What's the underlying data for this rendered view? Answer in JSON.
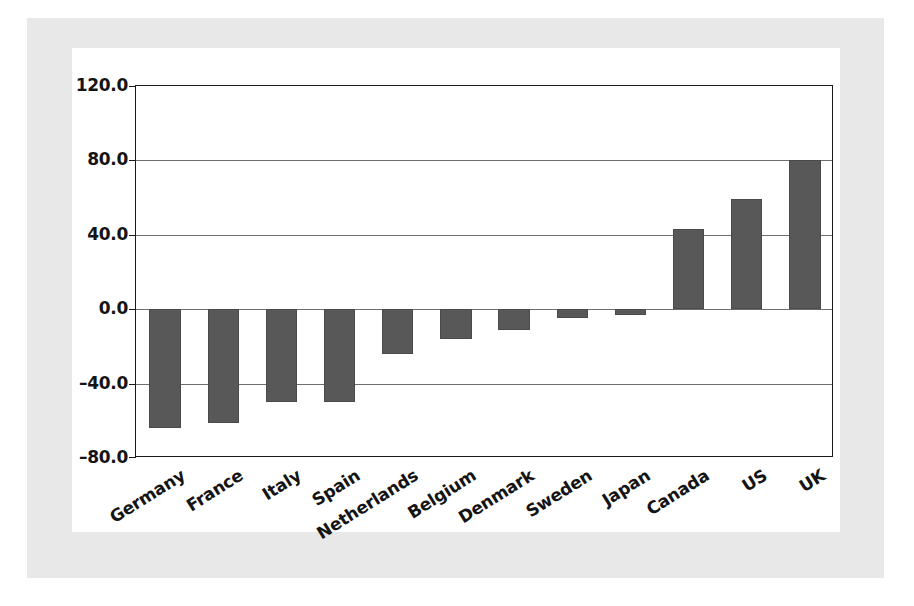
{
  "chart_data": {
    "type": "bar",
    "title": "",
    "subtitle": "",
    "xlabel": "",
    "ylabel": "",
    "categories": [
      "Germany",
      "France",
      "Italy",
      "Spain",
      "Netherlands",
      "Belgium",
      "Denmark",
      "Sweden",
      "Japan",
      "Canada",
      "US",
      "UK"
    ],
    "values": [
      -64,
      -61,
      -50,
      -50,
      -24,
      -16,
      -11,
      -5,
      -3,
      43,
      59,
      80
    ],
    "series": [
      {
        "name": "",
        "values": [
          -64,
          -61,
          -50,
          -50,
          -24,
          -16,
          -11,
          -5,
          -3,
          43,
          59,
          80
        ]
      }
    ],
    "ylim": [
      -80,
      120
    ],
    "ytick_values": [
      120,
      80,
      40,
      0,
      -40,
      -80
    ],
    "ytick_labels": [
      "120.0",
      "80.0",
      "40.0",
      "0.0",
      "–40.0",
      "–80.0"
    ],
    "grid": true,
    "gridlines_horizontal": [
      80,
      40,
      0,
      -40
    ],
    "legend": null,
    "legend_position": "none",
    "bar_color": "#585858",
    "bar_border_color": "#4a4a4a",
    "axis_color": "#1a1a1a",
    "gridline_color": "#6e6e6e",
    "plot_background": "#ffffff",
    "page_background": "#e8e8e8",
    "xtick_label_rotation": -32,
    "annotations": []
  }
}
